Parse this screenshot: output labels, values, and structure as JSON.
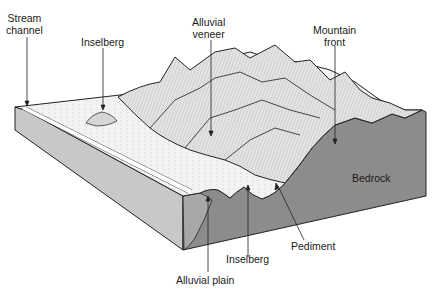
{
  "diagram": {
    "type": "block-diagram",
    "colors": {
      "bedrock": "#8a8a8a",
      "bedrock_light": "#bdbdbd",
      "surface": "#f2f2f2",
      "mountain": "#e6e6e6",
      "outline": "#222222"
    },
    "labels": {
      "stream_channel": [
        "Stream",
        "channel"
      ],
      "inselberg_top": "Inselberg",
      "alluvial_veneer": [
        "Alluvial",
        "veneer"
      ],
      "mountain_front": [
        "Mountain",
        "front"
      ],
      "bedrock": "Bedrock",
      "pediment": "Pediment",
      "inselberg_bottom": "Inselberg",
      "alluvial_plain": "Alluvial plain"
    }
  }
}
